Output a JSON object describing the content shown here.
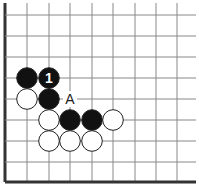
{
  "diagram": {
    "type": "go-board-fragment",
    "colors": {
      "background": "#ffffff",
      "grid_line": "#888888",
      "border": "#333333",
      "black_stone": "#111111",
      "white_stone": "#ffffff",
      "stone_outline": "#222222",
      "number_on_black": "#ffffff",
      "label_text": "#222222"
    },
    "grid": {
      "columns_x": [
        5,
        27,
        49,
        70,
        92,
        113,
        135,
        156,
        177
      ],
      "rows_y": [
        15,
        36,
        57,
        78,
        99,
        120,
        141,
        162,
        182
      ],
      "edges": [
        "left",
        "bottom"
      ]
    },
    "stones": [
      {
        "color": "black",
        "col": 1,
        "row": 3,
        "label": ""
      },
      {
        "color": "black",
        "col": 2,
        "row": 3,
        "label": "1"
      },
      {
        "color": "white",
        "col": 1,
        "row": 4,
        "label": ""
      },
      {
        "color": "black",
        "col": 2,
        "row": 4,
        "label": ""
      },
      {
        "color": "white",
        "col": 2,
        "row": 5,
        "label": ""
      },
      {
        "color": "black",
        "col": 3,
        "row": 5,
        "label": ""
      },
      {
        "color": "black",
        "col": 4,
        "row": 5,
        "label": ""
      },
      {
        "color": "white",
        "col": 5,
        "row": 5,
        "label": ""
      },
      {
        "color": "white",
        "col": 2,
        "row": 6,
        "label": ""
      },
      {
        "color": "white",
        "col": 3,
        "row": 6,
        "label": ""
      },
      {
        "color": "white",
        "col": 4,
        "row": 6,
        "label": ""
      }
    ],
    "markers": [
      {
        "text": "A",
        "col": 3,
        "row": 4
      }
    ]
  }
}
